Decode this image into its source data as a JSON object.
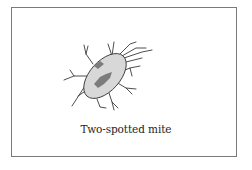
{
  "figure": {
    "caption": "Two-spotted mite",
    "colors": {
      "border": "#7a7a7a",
      "body_fill": "#d8d8d8",
      "spots": "#7c7c7c",
      "outline": "#3a3a3a",
      "caption": "#1e1e1e"
    }
  }
}
